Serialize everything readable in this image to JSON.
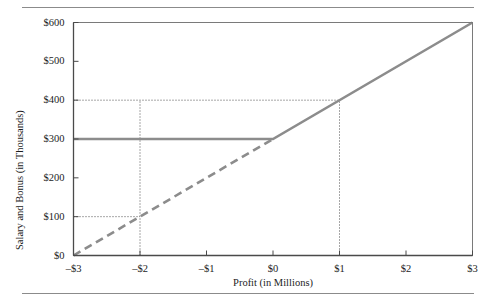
{
  "chart_data": {
    "type": "line",
    "title": "",
    "xlabel": "Profit (in Millions)",
    "ylabel": "Salary and Bonus (in Thousands)",
    "xlim": [
      -3,
      3
    ],
    "ylim": [
      0,
      600
    ],
    "grid": false,
    "legend": "none",
    "x_ticks": [
      -3,
      -2,
      -1,
      0,
      1,
      2,
      3
    ],
    "x_tick_labels": [
      "–$3",
      "–$2",
      "–$1",
      "$0",
      "$1",
      "$2",
      "$3"
    ],
    "y_ticks": [
      0,
      100,
      200,
      300,
      400,
      500,
      600
    ],
    "y_tick_labels": [
      "$0",
      "$100",
      "$200",
      "$300",
      "$400",
      "$500",
      "$600"
    ],
    "line_color": "#8c8c8c",
    "guide_color": "#3b3b3b",
    "axis_color": "#7a7a7a",
    "series": [
      {
        "name": "Actual pay (solid)",
        "style": "solid",
        "color": "#8c8c8c",
        "points": [
          {
            "x": -3,
            "y": 300
          },
          {
            "x": 0,
            "y": 300
          },
          {
            "x": 3,
            "y": 600
          }
        ]
      },
      {
        "name": "Unmodified linear schedule (dashed)",
        "style": "dashed",
        "color": "#8c8c8c",
        "points": [
          {
            "x": -3,
            "y": 0
          },
          {
            "x": 0,
            "y": 300
          }
        ]
      }
    ],
    "guide_lines": [
      {
        "name": "guide-100-horizontal",
        "orientation": "horizontal",
        "y": 100,
        "from_x": -3,
        "to_x": -2
      },
      {
        "name": "guide-neg2-vertical",
        "orientation": "vertical",
        "x": -2,
        "from_y": 0,
        "to_y": 400
      },
      {
        "name": "guide-400-horizontal",
        "orientation": "horizontal",
        "y": 400,
        "from_x": -3,
        "to_x": 1
      },
      {
        "name": "guide-1-vertical",
        "orientation": "vertical",
        "x": 1,
        "from_y": 0,
        "to_y": 400
      }
    ],
    "annotations": []
  }
}
